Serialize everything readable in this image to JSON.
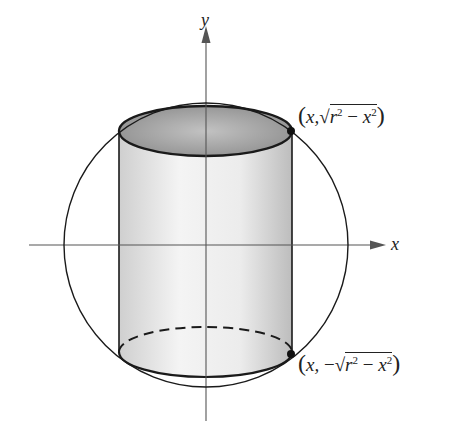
{
  "figure": {
    "type": "cylinder inscribed in sphere cross-section",
    "axes": {
      "x_label": "x",
      "y_label": "y"
    },
    "points": [
      {
        "name": "top-right",
        "x_text": "x,",
        "y_prefix": "",
        "root_r": "r",
        "root_exp": "2",
        "root_minus": " − ",
        "root_x": "x",
        "root_x_exp": "2"
      },
      {
        "name": "bottom-right",
        "x_text": "x,",
        "y_prefix": " −",
        "root_r": "r",
        "root_exp": "2",
        "root_minus": " − ",
        "root_x": "x",
        "root_x_exp": "2"
      }
    ],
    "colors": {
      "stroke": "#1a1a1a",
      "axis": "#555555",
      "top_fill": "#9a9a9a",
      "body_light": "#f2f2f2",
      "body_dark": "#c8c8c8"
    },
    "geometry": {
      "circle_center": [
        206,
        245
      ],
      "circle_radius": 143,
      "cylinder_left_x": 119,
      "cylinder_right_x": 292,
      "cylinder_top_y": 131,
      "cylinder_bottom_y": 352,
      "ellipse_ry": 25
    }
  }
}
